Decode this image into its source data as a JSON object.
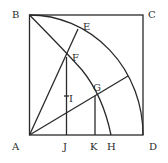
{
  "diagram": {
    "type": "geometric construction (quadratrix in square)",
    "labels": {
      "A": "A",
      "B": "B",
      "C": "C",
      "D": "D",
      "E": "E",
      "F": "F",
      "G": "G",
      "H": "H",
      "I": "I",
      "J": "J",
      "K": "K"
    },
    "colors": {
      "line": "#2a2a2a",
      "background": "#ffffff"
    }
  }
}
